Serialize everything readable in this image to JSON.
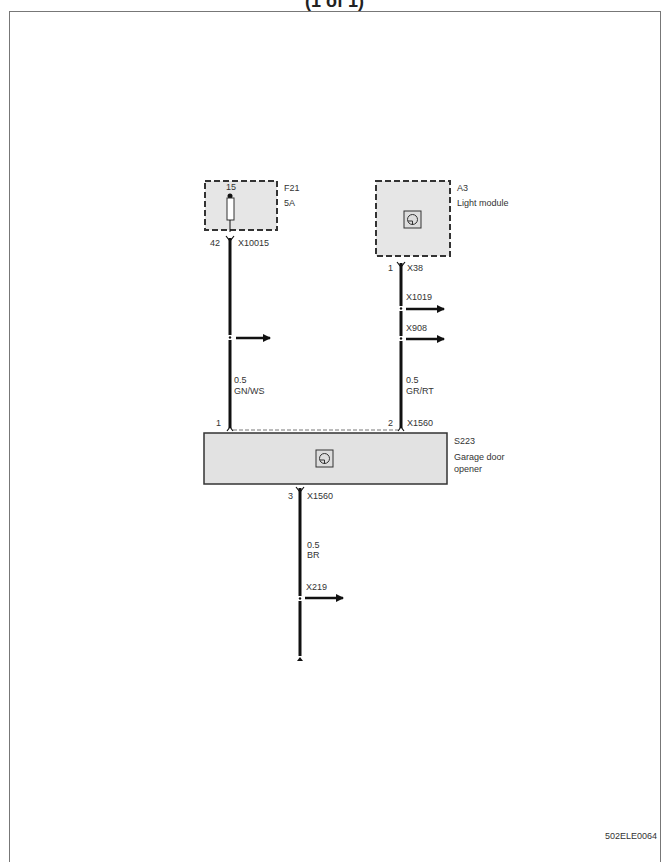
{
  "header": {
    "title": "(1 of 1)"
  },
  "footer": {
    "doc_id": "502ELE0064"
  },
  "components": {
    "fuse": {
      "id": "F21",
      "rating": "5A",
      "pin_top": "15",
      "pin_bottom": "42",
      "connector": "X10015"
    },
    "light_module": {
      "id": "A3",
      "name": "Light module",
      "pin": "1",
      "connector": "X38"
    },
    "garage_door_opener": {
      "id": "S223",
      "name_line1": "Garage door",
      "name_line2": "opener",
      "pin1": "1",
      "pin2": "2",
      "pin2_connector": "X1560",
      "pin3": "3",
      "pin3_connector": "X1560"
    }
  },
  "wires": {
    "left": {
      "size": "0.5",
      "color": "GN/WS"
    },
    "right": {
      "size": "0.5",
      "color": "GR/RT",
      "branches": [
        "X1019",
        "X908"
      ]
    },
    "bottom": {
      "size": "0.5",
      "color": "BR",
      "branch": "X219"
    }
  }
}
